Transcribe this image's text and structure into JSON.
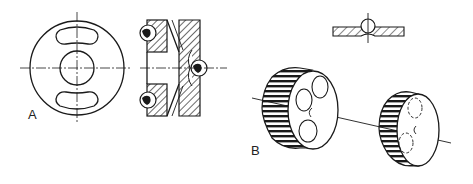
{
  "figure": {
    "title": "",
    "labels": {
      "a": "A",
      "b": "B"
    },
    "parts": {
      "a": [
        "front-view-disc",
        "cross-section-with-balls"
      ],
      "b": [
        "ball-on-plate-section",
        "toothed-gear-left",
        "toothed-gear-right",
        "shaft-axis"
      ]
    },
    "colors": {
      "ink": "#1a1a1a",
      "background": "#ffffff"
    }
  }
}
